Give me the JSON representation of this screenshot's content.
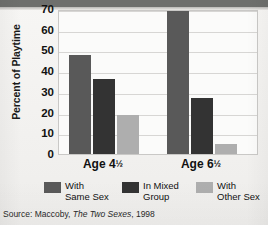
{
  "chart_data": {
    "type": "bar",
    "title": "",
    "xlabel": "",
    "ylabel": "Percent of Playtime",
    "categories": [
      "Age 4½",
      "Age 6½"
    ],
    "category_parts": [
      {
        "main": "Age 4",
        "fraction": "½"
      },
      {
        "main": "Age 6",
        "fraction": "½"
      }
    ],
    "series": [
      {
        "name": "With Same Sex",
        "values": [
          48,
          69
        ],
        "color": "#595959"
      },
      {
        "name": "In Mixed Group",
        "values": [
          36,
          27
        ],
        "color": "#333333"
      },
      {
        "name": "With Other Sex",
        "values": [
          19,
          5
        ],
        "color": "#aeaeae"
      }
    ],
    "ylim": [
      0,
      70
    ],
    "yticks": [
      0,
      10,
      20,
      30,
      40,
      50,
      60,
      70
    ],
    "ytick_labels": [
      "0",
      "10",
      "20",
      "30",
      "40",
      "50",
      "60",
      "70"
    ],
    "grid": true,
    "legend_position": "bottom"
  },
  "legend": {
    "items": [
      {
        "line1": "With",
        "line2": "Same Sex"
      },
      {
        "line1": "In Mixed",
        "line2": "Group"
      },
      {
        "line1": "With",
        "line2": "Other Sex"
      }
    ]
  },
  "source": {
    "prefix": "Source: Maccoby, ",
    "work": "The Two Sexes",
    "suffix": ", 1998"
  },
  "colors": {
    "series_1": "#595959",
    "series_2": "#333333",
    "series_3": "#aeaeae",
    "plot_background": "#fbfbfa",
    "page_background": "#f2f1ef",
    "gridline": "#d7d6d4",
    "top_band": "#6e6f6d"
  }
}
